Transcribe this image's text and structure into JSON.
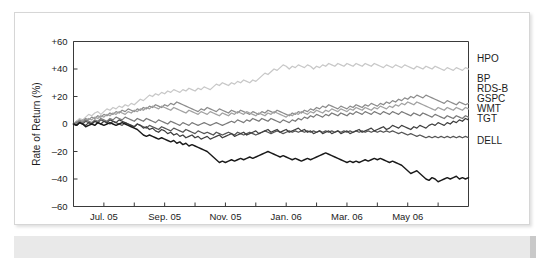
{
  "figure": {
    "background": "#ffffff",
    "card_border": "#d6d6d6",
    "caption_band_color": "#e9e9e9"
  },
  "chart_data": {
    "type": "line",
    "title": "",
    "subtitle": "",
    "xlabel": "",
    "ylabel": "Rate of Return (%)",
    "ylim": [
      -60,
      60
    ],
    "yticks": [
      60,
      40,
      20,
      0,
      -20,
      -40,
      -60
    ],
    "ytick_labels": [
      "+60",
      "+40",
      "+20",
      "0",
      "–20",
      "–40",
      "–60"
    ],
    "xlim": [
      0,
      13
    ],
    "xtick_labels": [
      "Jul. 05",
      "Sep. 05",
      "Nov. 05",
      "Jan. 06",
      "Mar. 06",
      "May 06"
    ],
    "xtick_positions": [
      1,
      3,
      5,
      7,
      9,
      11
    ],
    "minor_xticks": [
      1,
      2,
      3,
      4,
      5,
      6,
      7,
      8,
      9,
      10,
      11,
      12
    ],
    "grid": false,
    "legend_position": "right-outside",
    "x": [
      0,
      0.1,
      0.2,
      0.3,
      0.4,
      0.5,
      0.6,
      0.7,
      0.8,
      0.9,
      1,
      1.1,
      1.2,
      1.3,
      1.4,
      1.5,
      1.6,
      1.7,
      1.8,
      1.9,
      2,
      2.1,
      2.2,
      2.3,
      2.4,
      2.5,
      2.6,
      2.7,
      2.8,
      2.9,
      3,
      3.1,
      3.2,
      3.3,
      3.4,
      3.5,
      3.6,
      3.7,
      3.8,
      3.9,
      4,
      4.1,
      4.2,
      4.3,
      4.4,
      4.5,
      4.6,
      4.7,
      4.8,
      4.9,
      5,
      5.1,
      5.2,
      5.3,
      5.4,
      5.5,
      5.6,
      5.7,
      5.8,
      5.9,
      6,
      6.1,
      6.2,
      6.3,
      6.4,
      6.5,
      6.6,
      6.7,
      6.8,
      6.9,
      7,
      7.1,
      7.2,
      7.3,
      7.4,
      7.5,
      7.6,
      7.7,
      7.8,
      7.9,
      8,
      8.1,
      8.2,
      8.3,
      8.4,
      8.5,
      8.6,
      8.7,
      8.8,
      8.9,
      9,
      9.1,
      9.2,
      9.3,
      9.4,
      9.5,
      9.6,
      9.7,
      9.8,
      9.9,
      10,
      10.1,
      10.2,
      10.3,
      10.4,
      10.5,
      10.6,
      10.7,
      10.8,
      10.9,
      11,
      11.1,
      11.2,
      11.3,
      11.4,
      11.5,
      11.6,
      11.7,
      11.8,
      11.9,
      12,
      12.1,
      12.2,
      12.3,
      12.4,
      12.5,
      12.6,
      12.7,
      12.8,
      12.9,
      13
    ],
    "series": [
      {
        "name": "HPO",
        "label": "HPO",
        "color": "#c8c8c8",
        "width": 1.3,
        "end_value": 40,
        "values": [
          0,
          2,
          4,
          3,
          5,
          7,
          6,
          8,
          9,
          7,
          9,
          11,
          10,
          12,
          11,
          13,
          12,
          14,
          13,
          15,
          14,
          16,
          18,
          17,
          19,
          21,
          20,
          22,
          21,
          23,
          22,
          24,
          23,
          25,
          24,
          23,
          25,
          24,
          26,
          25,
          24,
          26,
          25,
          27,
          26,
          25,
          27,
          29,
          28,
          30,
          29,
          28,
          30,
          29,
          31,
          30,
          32,
          31,
          30,
          32,
          31,
          33,
          35,
          37,
          36,
          38,
          40,
          39,
          41,
          43,
          42,
          40,
          42,
          41,
          43,
          42,
          41,
          43,
          42,
          40,
          42,
          41,
          43,
          42,
          44,
          43,
          42,
          44,
          43,
          42,
          44,
          43,
          42,
          44,
          43,
          42,
          44,
          43,
          42,
          44,
          43,
          42,
          41,
          43,
          42,
          41,
          43,
          42,
          41,
          43,
          42,
          41,
          40,
          42,
          41,
          40,
          42,
          41,
          40,
          42,
          41,
          40,
          39,
          41,
          40,
          39,
          41,
          40,
          39,
          41,
          40
        ]
      },
      {
        "name": "BP",
        "label": "BP",
        "color": "#8c8c8c",
        "width": 1.3,
        "end_value": 15,
        "values": [
          0,
          1,
          3,
          2,
          4,
          3,
          5,
          4,
          6,
          5,
          7,
          6,
          8,
          7,
          9,
          8,
          10,
          9,
          11,
          10,
          9,
          11,
          10,
          12,
          11,
          13,
          12,
          14,
          13,
          12,
          14,
          13,
          15,
          14,
          16,
          15,
          14,
          13,
          12,
          11,
          10,
          9,
          11,
          10,
          12,
          11,
          10,
          9,
          11,
          10,
          9,
          8,
          10,
          9,
          8,
          10,
          9,
          8,
          7,
          9,
          8,
          7,
          9,
          8,
          10,
          9,
          8,
          10,
          9,
          8,
          7,
          6,
          8,
          7,
          9,
          8,
          10,
          9,
          11,
          10,
          12,
          11,
          13,
          12,
          14,
          13,
          12,
          11,
          13,
          12,
          11,
          13,
          12,
          14,
          13,
          12,
          14,
          13,
          15,
          14,
          13,
          15,
          14,
          16,
          15,
          17,
          16,
          18,
          17,
          19,
          18,
          20,
          19,
          21,
          20,
          19,
          21,
          20,
          19,
          18,
          17,
          16,
          15,
          17,
          16,
          15,
          14,
          16,
          15,
          14,
          15
        ]
      },
      {
        "name": "RDS-B",
        "label": "RDS-B",
        "color": "#a2a2a2",
        "width": 1.3,
        "end_value": 11,
        "values": [
          0,
          2,
          1,
          3,
          2,
          4,
          3,
          5,
          4,
          6,
          5,
          7,
          6,
          8,
          7,
          9,
          8,
          7,
          9,
          8,
          10,
          9,
          11,
          10,
          12,
          11,
          13,
          12,
          11,
          13,
          12,
          11,
          10,
          12,
          11,
          10,
          9,
          8,
          10,
          9,
          8,
          7,
          9,
          8,
          7,
          9,
          8,
          7,
          6,
          8,
          7,
          6,
          8,
          7,
          9,
          8,
          7,
          9,
          8,
          7,
          6,
          8,
          7,
          6,
          8,
          7,
          9,
          8,
          7,
          6,
          5,
          7,
          6,
          8,
          7,
          9,
          8,
          7,
          9,
          8,
          10,
          9,
          8,
          10,
          9,
          11,
          10,
          9,
          11,
          10,
          9,
          11,
          10,
          12,
          11,
          10,
          12,
          11,
          10,
          12,
          11,
          13,
          12,
          11,
          13,
          12,
          14,
          13,
          15,
          14,
          16,
          15,
          14,
          16,
          15,
          14,
          13,
          12,
          11,
          10,
          12,
          11,
          10,
          12,
          11,
          10,
          12,
          11,
          10,
          12,
          11
        ]
      },
      {
        "name": "GSPC",
        "label": "GSPC",
        "color": "#7a7a7a",
        "width": 1.3,
        "end_value": 5,
        "values": [
          0,
          1,
          2,
          1,
          3,
          2,
          1,
          3,
          2,
          4,
          3,
          2,
          4,
          3,
          5,
          4,
          3,
          5,
          4,
          3,
          2,
          4,
          3,
          2,
          4,
          3,
          2,
          1,
          3,
          2,
          1,
          0,
          2,
          1,
          0,
          -1,
          1,
          0,
          -1,
          1,
          0,
          -1,
          0,
          1,
          0,
          -1,
          0,
          1,
          0,
          -1,
          0,
          1,
          2,
          1,
          3,
          2,
          1,
          3,
          2,
          4,
          3,
          2,
          4,
          3,
          2,
          4,
          3,
          2,
          1,
          3,
          2,
          1,
          3,
          2,
          4,
          3,
          5,
          4,
          6,
          5,
          7,
          6,
          5,
          7,
          6,
          8,
          7,
          6,
          8,
          7,
          6,
          8,
          7,
          9,
          8,
          7,
          9,
          8,
          7,
          9,
          8,
          7,
          9,
          8,
          7,
          9,
          8,
          7,
          9,
          8,
          7,
          6,
          8,
          7,
          6,
          8,
          7,
          6,
          5,
          7,
          6,
          5,
          4,
          6,
          5,
          4,
          6,
          5,
          4,
          6,
          5
        ]
      },
      {
        "name": "WMT",
        "label": "WMT",
        "color": "#565656",
        "width": 1.3,
        "end_value": -10,
        "values": [
          0,
          -1,
          1,
          0,
          2,
          1,
          0,
          2,
          1,
          3,
          2,
          1,
          0,
          2,
          1,
          0,
          -1,
          1,
          0,
          -1,
          -2,
          0,
          -1,
          -2,
          -3,
          -1,
          -2,
          -3,
          -4,
          -2,
          -3,
          -4,
          -5,
          -3,
          -4,
          -5,
          -6,
          -4,
          -5,
          -6,
          -7,
          -5,
          -6,
          -7,
          -6,
          -7,
          -8,
          -6,
          -7,
          -8,
          -7,
          -6,
          -7,
          -8,
          -6,
          -7,
          -8,
          -7,
          -6,
          -7,
          -8,
          -7,
          -6,
          -5,
          -6,
          -7,
          -6,
          -5,
          -6,
          -7,
          -6,
          -5,
          -6,
          -5,
          -6,
          -5,
          -6,
          -5,
          -6,
          -5,
          -6,
          -5,
          -6,
          -5,
          -6,
          -5,
          -6,
          -5,
          -6,
          -5,
          -6,
          -5,
          -6,
          -5,
          -6,
          -5,
          -6,
          -5,
          -6,
          -5,
          -6,
          -5,
          -6,
          -5,
          -6,
          -5,
          -6,
          -7,
          -6,
          -7,
          -8,
          -7,
          -8,
          -9,
          -8,
          -9,
          -10,
          -9,
          -10,
          -9,
          -10,
          -9,
          -10,
          -9,
          -10,
          -9,
          -10,
          -9,
          -10,
          -9,
          -10
        ]
      },
      {
        "name": "TGT",
        "label": "TGT",
        "color": "#3f3f3f",
        "width": 1.3,
        "end_value": 3,
        "values": [
          0,
          -1,
          1,
          0,
          -1,
          1,
          0,
          2,
          1,
          0,
          2,
          1,
          3,
          2,
          1,
          3,
          2,
          1,
          0,
          -1,
          -2,
          0,
          -1,
          -3,
          -2,
          -4,
          -3,
          -5,
          -6,
          -4,
          -5,
          -7,
          -6,
          -8,
          -7,
          -9,
          -8,
          -10,
          -9,
          -8,
          -10,
          -9,
          -11,
          -10,
          -9,
          -11,
          -10,
          -9,
          -8,
          -10,
          -9,
          -8,
          -7,
          -9,
          -8,
          -7,
          -6,
          -8,
          -7,
          -6,
          -5,
          -7,
          -6,
          -5,
          -4,
          -6,
          -5,
          -4,
          -6,
          -5,
          -4,
          -6,
          -5,
          -4,
          -3,
          -5,
          -4,
          -6,
          -5,
          -7,
          -6,
          -5,
          -7,
          -6,
          -5,
          -7,
          -6,
          -5,
          -7,
          -6,
          -5,
          -7,
          -6,
          -5,
          -4,
          -6,
          -5,
          -4,
          -3,
          -5,
          -4,
          -3,
          -2,
          -4,
          -3,
          -1,
          -2,
          -3,
          -1,
          -2,
          -3,
          -4,
          -2,
          -3,
          -1,
          -2,
          -3,
          -1,
          0,
          -1,
          1,
          0,
          -1,
          1,
          0,
          2,
          1,
          3,
          2,
          4,
          3
        ]
      },
      {
        "name": "DELL",
        "label": "DELL",
        "color": "#1a1a1a",
        "width": 1.4,
        "end_value": -39,
        "values": [
          0,
          -1,
          1,
          0,
          -2,
          -1,
          0,
          -1,
          1,
          0,
          -1,
          0,
          1,
          0,
          -1,
          0,
          1,
          0,
          -1,
          -2,
          -3,
          -4,
          -6,
          -8,
          -9,
          -8,
          -9,
          -10,
          -11,
          -10,
          -11,
          -12,
          -13,
          -12,
          -14,
          -13,
          -15,
          -14,
          -16,
          -15,
          -16,
          -17,
          -18,
          -19,
          -20,
          -22,
          -24,
          -26,
          -28,
          -27,
          -28,
          -27,
          -26,
          -27,
          -26,
          -25,
          -26,
          -25,
          -24,
          -25,
          -24,
          -23,
          -22,
          -21,
          -20,
          -21,
          -22,
          -23,
          -24,
          -23,
          -24,
          -25,
          -26,
          -25,
          -26,
          -27,
          -26,
          -25,
          -26,
          -25,
          -24,
          -23,
          -22,
          -21,
          -22,
          -23,
          -24,
          -25,
          -26,
          -27,
          -28,
          -27,
          -28,
          -27,
          -28,
          -27,
          -26,
          -27,
          -26,
          -25,
          -26,
          -25,
          -26,
          -27,
          -28,
          -27,
          -28,
          -29,
          -30,
          -32,
          -34,
          -36,
          -35,
          -34,
          -36,
          -38,
          -40,
          -41,
          -39,
          -40,
          -42,
          -41,
          -40,
          -39,
          -40,
          -39,
          -38,
          -40,
          -39,
          -40,
          -39
        ]
      }
    ]
  },
  "legend": {
    "items": [
      {
        "label": "HPO"
      },
      {
        "label": "BP"
      },
      {
        "label": "RDS-B"
      },
      {
        "label": "GSPC"
      },
      {
        "label": "WMT"
      },
      {
        "label": "TGT"
      },
      {
        "label": "DELL"
      }
    ]
  }
}
